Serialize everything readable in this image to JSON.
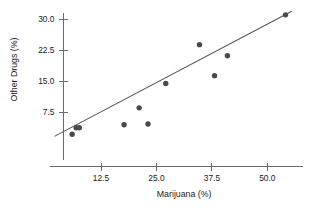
{
  "chart_data": {
    "type": "scatter",
    "title": "",
    "xlabel": "Marijuana (%)",
    "ylabel": "Other Drugs (%)",
    "xlim": [
      2.0,
      55.5
    ],
    "ylim": [
      0.5,
      32.0
    ],
    "xticks": [
      12.5,
      25.0,
      37.5,
      50.0
    ],
    "yticks": [
      7.5,
      15.0,
      22.5,
      30.0
    ],
    "xtick_labels": [
      "12.5",
      "25.0",
      "37.5",
      "50.0"
    ],
    "ytick_labels": [
      "7.5",
      "15.0",
      "22.5",
      "30.0"
    ],
    "grid": false,
    "legend": null,
    "point_color": "#4a4a4a",
    "line_color": "#555555",
    "axis_color": "#6b6b6b",
    "points": [
      {
        "x": 6.0,
        "y": 2.1
      },
      {
        "x": 6.9,
        "y": 3.7
      },
      {
        "x": 7.6,
        "y": 3.7
      },
      {
        "x": 17.7,
        "y": 4.4
      },
      {
        "x": 21.1,
        "y": 8.5
      },
      {
        "x": 23.1,
        "y": 4.6
      },
      {
        "x": 27.1,
        "y": 14.4
      },
      {
        "x": 34.7,
        "y": 23.8
      },
      {
        "x": 38.1,
        "y": 16.3
      },
      {
        "x": 41.0,
        "y": 21.1
      },
      {
        "x": 54.1,
        "y": 31.0
      }
    ],
    "fit_line": {
      "x_start": 2.0,
      "y_start": 1.6,
      "x_end": 55.5,
      "y_end": 31.9
    }
  }
}
